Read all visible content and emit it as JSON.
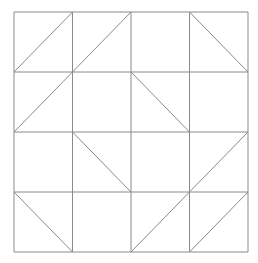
{
  "title": {
    "text": "",
    "note": "clipped at top edge, illegible"
  },
  "grid": {
    "rows": 4,
    "cols": 4,
    "x0": 14,
    "y0": 12,
    "x1": 248,
    "y1": 252,
    "stroke": "#8a8a8a",
    "stroke_width": 1,
    "cells": [
      [
        "/",
        "/",
        "",
        "\\"
      ],
      [
        "/",
        "",
        "\\",
        ""
      ],
      [
        "",
        "\\",
        "",
        "/"
      ],
      [
        "\\",
        "",
        "/",
        "/"
      ]
    ]
  }
}
